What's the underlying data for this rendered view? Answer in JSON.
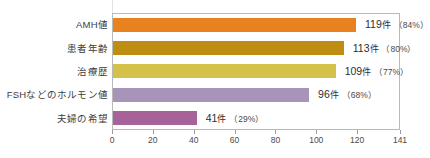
{
  "chart_data": {
    "type": "bar",
    "orientation": "horizontal",
    "title": "",
    "xlabel": "",
    "ylabel": "",
    "xlim": [
      0,
      141
    ],
    "grid": false,
    "legend": null,
    "xticks": [
      0,
      20,
      40,
      60,
      80,
      100,
      120,
      141
    ],
    "xtick_labels": [
      "0",
      "20",
      "40",
      "60",
      "80",
      "100",
      "120",
      "141"
    ],
    "categories": [
      "AMH値",
      "患者年齢",
      "治療歴",
      "FSHなどのホルモン値",
      "夫婦の希望"
    ],
    "values": [
      119,
      113,
      109,
      96,
      41
    ],
    "percents": [
      84,
      80,
      77,
      68,
      29
    ],
    "unit": "件",
    "colors": [
      "#E8821E",
      "#BE8E12",
      "#D4C14A",
      "#A794B8",
      "#A8629A"
    ],
    "bars": [
      {
        "category": "AMH値",
        "value": 119,
        "percent": 84,
        "color": "#E8821E",
        "value_text": "119",
        "unit_text": "件",
        "percent_text": "（84%）"
      },
      {
        "category": "患者年齢",
        "value": 113,
        "percent": 80,
        "color": "#BE8E12",
        "value_text": "113",
        "unit_text": "件",
        "percent_text": "（80%）"
      },
      {
        "category": "治療歴",
        "value": 109,
        "percent": 77,
        "color": "#D4C14A",
        "value_text": "109",
        "unit_text": "件",
        "percent_text": "（77%）"
      },
      {
        "category": "FSHなどのホルモン値",
        "value": 96,
        "percent": 68,
        "color": "#A794B8",
        "value_text": "96",
        "unit_text": "件",
        "percent_text": "（68%）"
      },
      {
        "category": "夫婦の希望",
        "value": 41,
        "percent": 29,
        "color": "#A8629A",
        "value_text": "41",
        "unit_text": "件",
        "percent_text": "（29%）"
      }
    ]
  }
}
